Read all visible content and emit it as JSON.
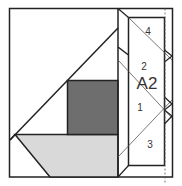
{
  "diagram": {
    "type": "quilt-block-foundation-pattern",
    "colors": {
      "line": "#222222",
      "thin_line": "#444444",
      "dark_fill": "#6e6e6e",
      "light_fill": "#d9d9d9",
      "background": "#ffffff"
    },
    "section_label": "A2",
    "piece_labels": [
      {
        "id": "4",
        "text": "4"
      },
      {
        "id": "2",
        "text": "2"
      },
      {
        "id": "1",
        "text": "1"
      },
      {
        "id": "3",
        "text": "3"
      }
    ]
  }
}
